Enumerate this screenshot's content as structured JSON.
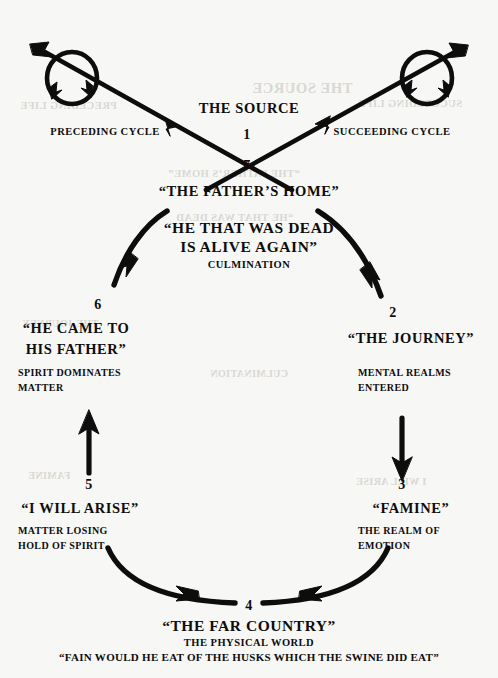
{
  "diagram": {
    "background_color": "#f7f7f5",
    "ink_color": "#0d0d0d",
    "top": {
      "source_label": "THE SOURCE",
      "preceding_cycle": "PRECEDING CYCLE",
      "succeeding_cycle": "SUCCEEDING CYCLE",
      "number_above_cross": "1",
      "number_below_cross": "7",
      "fathers_home": "“THE FATHER’S HOME”"
    },
    "culmination": {
      "line1": "“HE THAT WAS DEAD",
      "line2": "IS ALIVE AGAIN”",
      "caption": "CULMINATION"
    },
    "stations": [
      {
        "number": "2",
        "title": "“THE JOURNEY”",
        "caption_line1": "MENTAL REALMS",
        "caption_line2": "ENTERED"
      },
      {
        "number": "3",
        "title": "“FAMINE”",
        "caption_line1": "THE REALM OF",
        "caption_line2": "EMOTION"
      },
      {
        "number": "4",
        "title": "“THE FAR COUNTRY”",
        "caption_line1": "THE PHYSICAL WORLD",
        "caption_line2": "“FAIN WOULD HE EAT OF THE HUSKS WHICH THE SWINE DID EAT”"
      },
      {
        "number": "5",
        "title": "“I WILL ARISE”",
        "caption_line1": "MATTER LOSING",
        "caption_line2": "HOLD OF SPIRIT"
      },
      {
        "number": "6",
        "title_line1": "“HE CAME TO",
        "title_line2": "HIS FATHER”",
        "caption_line1": "SPIRIT DOMINATES",
        "caption_line2": "MATTER"
      }
    ],
    "bleed_through": {
      "note": "faint mirrored show-through from reverse of page",
      "items": [
        "THE SOURCE",
        "PRECEDING LIFE",
        "SUCCEEDING LIFE",
        "“THE FATHER’S HOME”",
        "“HE THAT WAS DEAD",
        "THE JOURNEY",
        "FAMINE",
        "I WILL ARISE",
        "CULMINATION"
      ]
    }
  }
}
